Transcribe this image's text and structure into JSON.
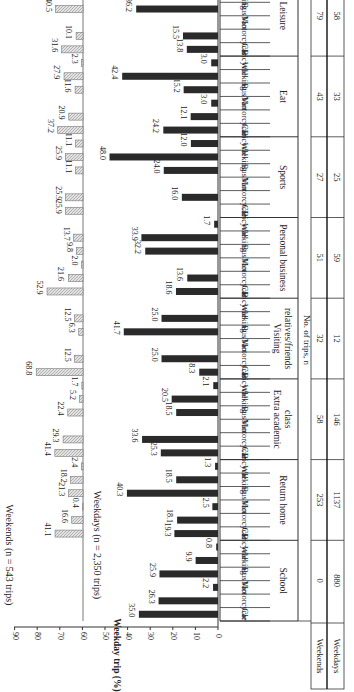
{
  "chart_data": {
    "type": "bar",
    "orientation": "rotated-90",
    "purposes": [
      "School",
      "Return home",
      "Extra academic class",
      "Visiting relatives/friends",
      "Personal business",
      "Sports",
      "Eat",
      "Leisure"
    ],
    "modes": [
      "Car",
      "Motorcycle",
      "Van",
      "Bus",
      "Walking",
      "Bicycle"
    ],
    "series": [
      {
        "name": "Weekdays (n = 2,350 trips)",
        "axis_label": "Weekday trip (%)",
        "axis_ticks": [
          0,
          10,
          20,
          30,
          40,
          50,
          60,
          70,
          80,
          90
        ],
        "ylim": [
          0,
          90
        ],
        "color": "#2a2a2a",
        "values": {
          "School": [
            35.0,
            26.3,
            2.2,
            25.9,
            9.9,
            0.8
          ],
          "Return home": [
            19.3,
            18.1,
            2.5,
            40.3,
            18.5,
            1.3
          ],
          "Extra academic class": [
            25.3,
            33.6,
            0,
            18.5,
            20.5,
            2.1
          ],
          "Visiting relatives/friends": [
            8.3,
            25.0,
            0,
            41.7,
            25.0,
            0
          ],
          "Personal business": [
            18.6,
            13.6,
            0,
            32.2,
            33.9,
            1.7
          ],
          "Sports": [
            0,
            16.0,
            0,
            24.0,
            48.0,
            12.0
          ],
          "Eat": [
            24.2,
            12.1,
            3.0,
            15.2,
            42.4,
            3.0
          ],
          "Leisure": [
            13.8,
            15.5,
            0,
            36.2,
            34.5,
            0
          ]
        },
        "labels": {
          "School": [
            "35.0",
            "26.3",
            "2.2",
            "25.9",
            "9.9",
            "0.8"
          ],
          "Return home": [
            "19.3",
            "18.1",
            "2.5",
            "40.3",
            "18.5",
            "1.3"
          ],
          "Extra academic class": [
            "25.3",
            "33.6",
            "",
            "18.5",
            "20.5",
            "2.1"
          ],
          "Visiting relatives/friends": [
            "8.3",
            "25.0",
            "",
            "41.7",
            "25.0",
            ""
          ],
          "Personal business": [
            "18.6",
            "13.6",
            "",
            "32.2",
            "33.9",
            "1.7"
          ],
          "Sports": [
            "",
            "16.0",
            "",
            "24.0",
            "48.0",
            "12.0"
          ],
          "Eat": [
            "24.2",
            "12.1",
            "3.0",
            "15.2",
            "42.4",
            "3.0"
          ],
          "Leisure": [
            "13.8",
            "15.5",
            "",
            "36.2",
            "34.5",
            ""
          ]
        }
      },
      {
        "name": "Weekends (n = 543 trips)",
        "axis_label": "Weekend trip (%)",
        "axis_ticks": [
          -200,
          -150,
          -100,
          -50,
          0,
          50,
          100
        ],
        "ylim": [
          -200,
          100
        ],
        "color": "#bdbdbd",
        "values": {
          "School": [
            0,
            0,
            0,
            0,
            0,
            0
          ],
          "Return home": [
            41.1,
            16.6,
            0.4,
            21.3,
            18.2,
            2.4
          ],
          "Extra academic class": [
            41.4,
            29.3,
            0,
            22.4,
            5.2,
            1.7
          ],
          "Visiting relatives/friends": [
            68.8,
            12.5,
            0,
            6.3,
            12.5,
            0
          ],
          "Personal business": [
            52.9,
            21.6,
            2.0,
            9.8,
            13.7,
            0
          ],
          "Sports": [
            25.9,
            25.9,
            0,
            11.1,
            25.9,
            11.1
          ],
          "Eat": [
            37.2,
            20.9,
            0,
            11.6,
            27.9,
            2.3
          ],
          "Leisure": [
            31.6,
            10.1,
            0,
            40.5,
            16.5,
            1.3
          ]
        },
        "labels": {
          "School": [
            "",
            "",
            "",
            "",
            "",
            ""
          ],
          "Return home": [
            "41.1",
            "16.6",
            "0.4",
            "21.3",
            "18.2",
            "2.4"
          ],
          "Extra academic class": [
            "41.4",
            "29.3",
            "",
            "22.4",
            "5.2",
            "1.7"
          ],
          "Visiting relatives/friends": [
            "68.8",
            "12.5",
            "",
            "6.3",
            "12.5",
            ""
          ],
          "Personal business": [
            "52.9",
            "21.6",
            "2.0",
            "9.8",
            "13.7",
            ""
          ],
          "Sports": [
            "25.9",
            "25.9",
            "",
            "11.1",
            "25.9",
            "11.1"
          ],
          "Eat": [
            "37.2",
            "20.9",
            "",
            "11.6",
            "27.9",
            "2.3"
          ],
          "Leisure": [
            "31.6",
            "10.1",
            "",
            "40.5",
            "16.5",
            "1.3"
          ]
        }
      }
    ],
    "table": {
      "row_header": "No. of trips, n",
      "rows": [
        {
          "label": "Weekends",
          "values": [
            0,
            253,
            58,
            32,
            51,
            27,
            43,
            79
          ]
        },
        {
          "label": "Weekdays",
          "values": [
            880,
            1137,
            146,
            12,
            59,
            25,
            33,
            58
          ]
        }
      ]
    },
    "purpose_display": [
      [
        "School"
      ],
      [
        "Return home"
      ],
      [
        "Extra academic",
        "class"
      ],
      [
        "Visiting",
        "relatives/friends"
      ],
      [
        "Personal business"
      ],
      [
        "Sports"
      ],
      [
        "Eat"
      ],
      [
        "Leisure"
      ]
    ],
    "title": "",
    "legend": "inside-left",
    "grid": false
  }
}
